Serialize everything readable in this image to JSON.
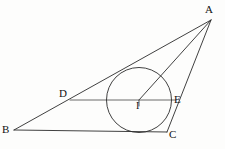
{
  "figure": {
    "kind": "geometry-diagram",
    "canvas": {
      "width": 225,
      "height": 149
    },
    "background_color": "#fdfdfc",
    "stroke_color": "#2b2b2b",
    "label_color": "#121212",
    "stroke_width": 0.9
  },
  "points": [
    {
      "id": "A",
      "label": "A",
      "x": 211,
      "y": 20,
      "label_x": 205,
      "label_y": 4,
      "role": "apex-vertex"
    },
    {
      "id": "B",
      "label": "B",
      "x": 14,
      "y": 130,
      "label_x": 2,
      "label_y": 124,
      "role": "left-vertex"
    },
    {
      "id": "C",
      "label": "C",
      "x": 167,
      "y": 132,
      "label_x": 169,
      "label_y": 129,
      "role": "right-vertex"
    },
    {
      "id": "D",
      "label": "D",
      "x": 70,
      "y": 100,
      "label_x": 59,
      "label_y": 88,
      "role": "point-on-side-AB"
    },
    {
      "id": "E",
      "label": "E",
      "x": 172,
      "y": 100,
      "label_x": 174,
      "label_y": 94,
      "role": "point-on-side-AC"
    },
    {
      "id": "I",
      "label": "I",
      "x": 139,
      "y": 100,
      "label_x": 136,
      "label_y": 101,
      "role": "incenter"
    }
  ],
  "circle": {
    "id": "incircle",
    "center_x": 139,
    "center_y": 100,
    "radius": 32.5,
    "label": "inscribed circle"
  },
  "segments": [
    {
      "id": "AB",
      "from": "A",
      "to": "B",
      "label": "AB"
    },
    {
      "id": "BC",
      "from": "B",
      "to": "C",
      "label": "BC"
    },
    {
      "id": "CA",
      "from": "C",
      "to": "A",
      "label": "CA"
    },
    {
      "id": "AI",
      "from": "A",
      "to": "I",
      "label": "AI"
    },
    {
      "id": "DE",
      "from": "D",
      "to": "E",
      "label": "DE"
    }
  ]
}
